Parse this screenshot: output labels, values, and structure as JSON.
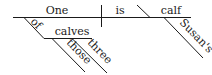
{
  "diagram": {
    "type": "sentence-diagram",
    "subject": "One",
    "verb": "is",
    "predicate_nominative": "calf",
    "subject_modifier_preposition": "of",
    "prepositional_object": "calves",
    "object_modifiers": [
      "those",
      "three"
    ],
    "predicate_modifier": "Susan's"
  }
}
